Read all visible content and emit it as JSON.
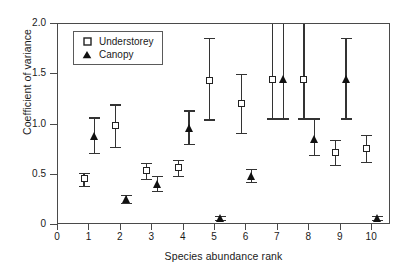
{
  "chart_data": {
    "type": "scatter",
    "title": "",
    "xlabel": "Species abundance rank",
    "ylabel": "Coefficient of variance",
    "xlim": [
      0,
      10.6
    ],
    "ylim": [
      0,
      2.0
    ],
    "xticks": [
      "0",
      "1",
      "2",
      "3",
      "4",
      "5",
      "6",
      "7",
      "8",
      "9",
      "10"
    ],
    "yticks": [
      "0",
      "0.5",
      "1.0",
      "1.5",
      "2.0"
    ],
    "grid": false,
    "legend_position": "top-left",
    "x": [
      1,
      2,
      3,
      4,
      5,
      6,
      7,
      8,
      9,
      10
    ],
    "series": [
      {
        "name": "Understorey",
        "marker": "open-square",
        "x_offset": -0.17,
        "values": [
          0.46,
          0.99,
          0.54,
          0.57,
          1.44,
          1.21,
          1.45,
          1.45,
          0.72,
          0.76
        ],
        "err_low": [
          0.39,
          0.78,
          0.46,
          0.49,
          1.05,
          0.92,
          1.06,
          1.06,
          0.6,
          0.63
        ],
        "err_high": [
          0.52,
          1.2,
          0.62,
          0.65,
          1.86,
          1.5,
          2.0,
          2.0,
          0.85,
          0.9
        ]
      },
      {
        "name": "Canopy",
        "marker": "filled-triangle",
        "x_offset": 0.17,
        "values": [
          0.89,
          0.26,
          0.41,
          0.97,
          0.07,
          0.49,
          1.45,
          0.86,
          1.45,
          0.07
        ],
        "err_low": [
          0.72,
          0.22,
          0.34,
          0.81,
          0.05,
          0.43,
          1.06,
          0.7,
          1.06,
          0.05
        ],
        "err_high": [
          1.07,
          0.3,
          0.49,
          1.14,
          0.09,
          0.56,
          2.0,
          1.06,
          1.86,
          0.09
        ]
      }
    ]
  },
  "legend": {
    "entries": [
      {
        "label": "Understorey",
        "marker": "open-square"
      },
      {
        "label": "Canopy",
        "marker": "filled-triangle"
      }
    ]
  }
}
